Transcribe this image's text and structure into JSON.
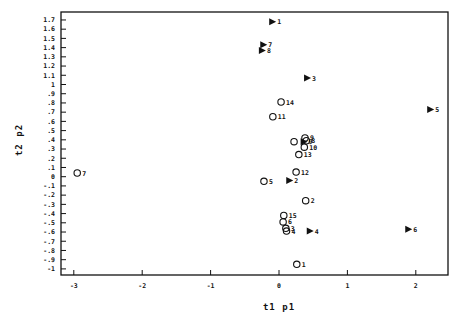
{
  "chart_data": {
    "type": "scatter",
    "title": "",
    "xlabel": "t1 p1",
    "ylabel": "t2 p2",
    "xlim": [
      -3.07,
      2.48
    ],
    "ylim": [
      -1.07,
      1.79
    ],
    "grid": false,
    "legend": null,
    "x_ticks": [
      -3,
      -2,
      -1,
      0,
      1,
      2
    ],
    "x_tick_labels": [
      "-3",
      "-2",
      "-1",
      "0",
      "1",
      "2"
    ],
    "y_ticks": [
      1.7,
      1.6,
      1.5,
      1.4,
      1.3,
      1.2,
      1.1,
      1,
      0.9,
      0.8,
      0.7,
      0.6,
      0.5,
      0.4,
      0.3,
      0.2,
      0.1,
      0,
      -0.1,
      -0.2,
      -0.3,
      -0.4,
      -0.5,
      -0.6,
      -0.7,
      -0.8,
      -0.9,
      -1
    ],
    "y_tick_labels": [
      "1.7",
      "1.6",
      "1.5",
      "1.4",
      "1.3",
      "1.2",
      "1.1",
      "1",
      ".9",
      ".8",
      ".7",
      ".6",
      ".5",
      ".4",
      ".3",
      ".2",
      ".1",
      "0",
      "-.1",
      "-.2",
      "-.3",
      "-.4",
      "-.5",
      "-.6",
      "-.7",
      "-.8",
      "-.9",
      "-1"
    ],
    "series": [
      {
        "name": "loadings (triangles)",
        "marker": "filled-triangle-right",
        "points": [
          {
            "label": "1",
            "x": -0.1,
            "y": 1.68
          },
          {
            "label": "7",
            "x": -0.23,
            "y": 1.43
          },
          {
            "label": "8",
            "x": -0.25,
            "y": 1.37
          },
          {
            "label": "3",
            "x": 0.41,
            "y": 1.07
          },
          {
            "label": "5",
            "x": 2.21,
            "y": 0.73
          },
          {
            "label": "9",
            "x": 0.36,
            "y": 0.38
          },
          {
            "label": "2",
            "x": 0.15,
            "y": -0.04
          },
          {
            "label": "4",
            "x": 0.45,
            "y": -0.59
          },
          {
            "label": "6",
            "x": 1.89,
            "y": -0.57
          }
        ]
      },
      {
        "name": "scores (circles)",
        "marker": "open-circle",
        "points": [
          {
            "label": "14",
            "x": 0.03,
            "y": 0.81
          },
          {
            "label": "11",
            "x": -0.09,
            "y": 0.65
          },
          {
            "label": "9",
            "x": 0.38,
            "y": 0.42
          },
          {
            "label": "8",
            "x": 0.4,
            "y": 0.39
          },
          {
            "label": "",
            "x": 0.22,
            "y": 0.38
          },
          {
            "label": "10",
            "x": 0.37,
            "y": 0.32
          },
          {
            "label": "13",
            "x": 0.29,
            "y": 0.24
          },
          {
            "label": "12",
            "x": 0.25,
            "y": 0.05
          },
          {
            "label": "5",
            "x": -0.22,
            "y": -0.05
          },
          {
            "label": "2",
            "x": 0.39,
            "y": -0.26
          },
          {
            "label": "15",
            "x": 0.07,
            "y": -0.42
          },
          {
            "label": "6",
            "x": 0.06,
            "y": -0.49
          },
          {
            "label": "3",
            "x": 0.1,
            "y": -0.56
          },
          {
            "label": "4",
            "x": 0.11,
            "y": -0.59
          },
          {
            "label": "1",
            "x": 0.26,
            "y": -0.95
          },
          {
            "label": "7",
            "x": -2.95,
            "y": 0.04
          }
        ]
      }
    ]
  },
  "layout": {
    "plot_left": 61,
    "plot_top": 12,
    "plot_right": 448,
    "plot_bottom": 275,
    "x0_px": 279,
    "x_px_per_unit": 68.4,
    "y0_px": 176.7,
    "y_px_per_unit": 92.2
  }
}
